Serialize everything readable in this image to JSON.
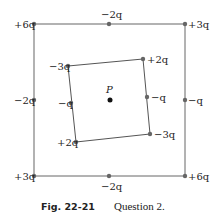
{
  "figure": {
    "caption_number": "Fig. 22-21",
    "caption_text": "Question 2.",
    "point_label": "P"
  },
  "outer_square": {
    "top_left": "+6q",
    "top_mid": "−2q",
    "top_right": "+3q",
    "left_mid": "−2q",
    "right_mid": "−q",
    "bottom_left": "+3q",
    "bottom_mid": "−2q",
    "bottom_right": "+6q"
  },
  "inner_square": {
    "top_left": "−3q",
    "top_right": "+2q",
    "left_mid": "−q",
    "right_mid": "−q",
    "bottom_left": "+2q",
    "bottom_right": "−3q"
  },
  "colors": {
    "line": "#666666",
    "dot": "#666666",
    "center": "#111111"
  }
}
